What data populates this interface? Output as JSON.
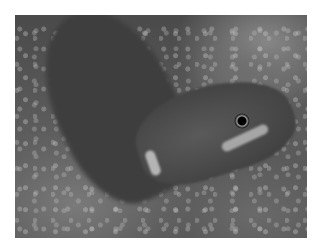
{
  "image": {
    "subject": "gecko on rock",
    "style": "grayscale photograph",
    "border_color": "#ffffff",
    "frame": {
      "x": 15,
      "y": 15,
      "width": 292,
      "height": 223
    }
  }
}
